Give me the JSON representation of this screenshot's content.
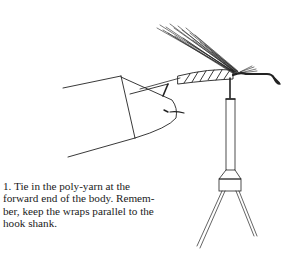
{
  "figure": {
    "step_number": "1.",
    "caption": "Tie in the poly-yarn at the forward end of the body. Remember, keep the wraps parallel to the hook shank.",
    "caption_lines": [
      "1. Tie in the poly-yarn at the",
      "forward end of the body. Remem-",
      "ber, keep the wraps parallel to the",
      "hook shank."
    ],
    "illustration": {
      "subject": "fly-tying-step",
      "elements": [
        "fingers-holding-thread",
        "poly-yarn-wing",
        "wrapped-body",
        "hook-eye",
        "vise-jaw",
        "vise-stem",
        "vise-base-legs"
      ],
      "ink_color": "#1a1a1a",
      "paper_color": "#ffffff"
    }
  }
}
